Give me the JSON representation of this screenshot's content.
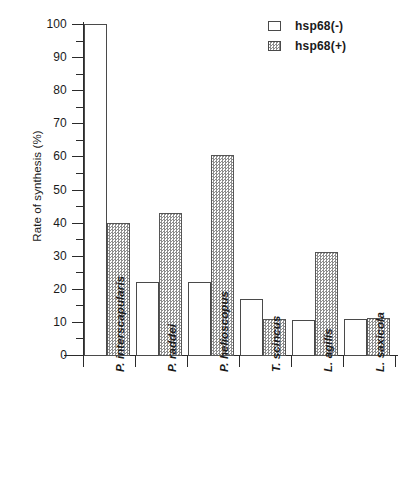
{
  "chart_data": {
    "type": "bar",
    "title": "",
    "xlabel": "",
    "ylabel": "Rate of synthesis (%)",
    "ylim": [
      0,
      100
    ],
    "yticks": [
      0,
      10,
      20,
      30,
      40,
      50,
      60,
      70,
      80,
      90,
      100
    ],
    "ytick_labels": [
      "0",
      "10",
      "20",
      "30",
      "40",
      "50",
      "60",
      "70",
      "80",
      "90",
      "100"
    ],
    "yminor_step": 5,
    "grid": false,
    "legend_position": "top-right",
    "categories": [
      "P. interscapularis",
      "P. raddei",
      "P. helioscopus",
      "T. scincus",
      "L. agilis",
      "L. saxicola"
    ],
    "series": [
      {
        "name": "hsp68(-)",
        "fill": "open",
        "values": [
          100,
          22,
          22,
          17,
          10.5,
          11
        ]
      },
      {
        "name": "hsp68(+)",
        "fill": "hatched",
        "values": [
          40,
          43,
          60.5,
          11,
          31,
          11.3
        ]
      }
    ],
    "colors": {
      "axis": "#2b2b2b",
      "bar_outline": "#4a4a4a",
      "hatch_gray": "#8d8d8d",
      "background": "#ffffff",
      "text": "#1a1a1a"
    }
  },
  "legend": {
    "items": [
      {
        "label": "hsp68(-)"
      },
      {
        "label": "hsp68(+)"
      }
    ]
  }
}
